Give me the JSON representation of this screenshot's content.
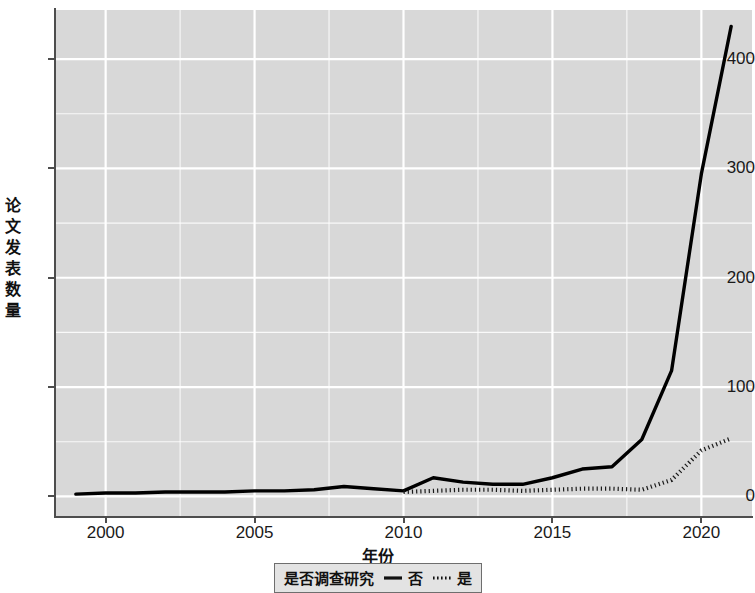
{
  "chart_data": {
    "type": "line",
    "title": "",
    "xlabel": "年份",
    "ylabel": "论文发表数量",
    "xlim": [
      1998.3,
      2021.7
    ],
    "ylim": [
      -18,
      445
    ],
    "grid": true,
    "grid_color": "#ffffff",
    "panel_color": "#d8d8d8",
    "legend_position": "bottom",
    "legend_title": "是否调查研究",
    "x_ticks": [
      2000,
      2005,
      2010,
      2015,
      2020
    ],
    "x_tick_labels": [
      "2000",
      "2005",
      "2010",
      "2015",
      "2020"
    ],
    "y_ticks": [
      0,
      100,
      200,
      300,
      400
    ],
    "y_tick_labels": [
      "0",
      "100",
      "200",
      "300",
      "400"
    ],
    "series": [
      {
        "name": "否",
        "linestyle": "solid",
        "color": "#000000",
        "x": [
          1999,
          2000,
          2001,
          2002,
          2003,
          2004,
          2005,
          2006,
          2007,
          2008,
          2009,
          2010,
          2011,
          2012,
          2013,
          2014,
          2015,
          2016,
          2017,
          2018,
          2019,
          2020,
          2021
        ],
        "values": [
          2,
          3,
          3,
          4,
          4,
          4,
          5,
          5,
          6,
          9,
          7,
          5,
          17,
          13,
          11,
          11,
          17,
          25,
          27,
          52,
          115,
          295,
          430
        ]
      },
      {
        "name": "是",
        "linestyle": "dotted",
        "color": "#1a1a1a",
        "x": [
          2010,
          2011,
          2012,
          2013,
          2014,
          2015,
          2016,
          2017,
          2018,
          2019,
          2020,
          2021
        ],
        "values": [
          4,
          5,
          6,
          6,
          5,
          6,
          7,
          7,
          6,
          15,
          42,
          53
        ]
      }
    ]
  },
  "axis": {
    "y_title": "论文发表数量",
    "x_title": "年份"
  },
  "legend": {
    "title": "是否调查研究",
    "items": [
      {
        "label": "否",
        "style": "solid",
        "icon": "solid-line-icon"
      },
      {
        "label": "是",
        "style": "dotted",
        "icon": "dotted-line-icon"
      }
    ]
  }
}
